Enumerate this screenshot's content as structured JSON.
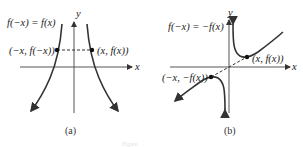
{
  "panels": [
    {
      "id": "a",
      "caption": "(a)",
      "equation": "f(−x) = f(x)",
      "point_left": "(−x, f(−x))",
      "point_right": "(x, f(x))",
      "axis_x": "x",
      "axis_y": "y",
      "symmetry": "even — symmetric about y-axis"
    },
    {
      "id": "b",
      "caption": "(b)",
      "equation": "f(−x) = −f(x)",
      "point_left": "(−x, −f(x))",
      "point_right": "(x, f(x))",
      "axis_x": "x",
      "axis_y": "y",
      "symmetry": "odd — symmetric about origin"
    }
  ],
  "footer_caption": "Figure"
}
